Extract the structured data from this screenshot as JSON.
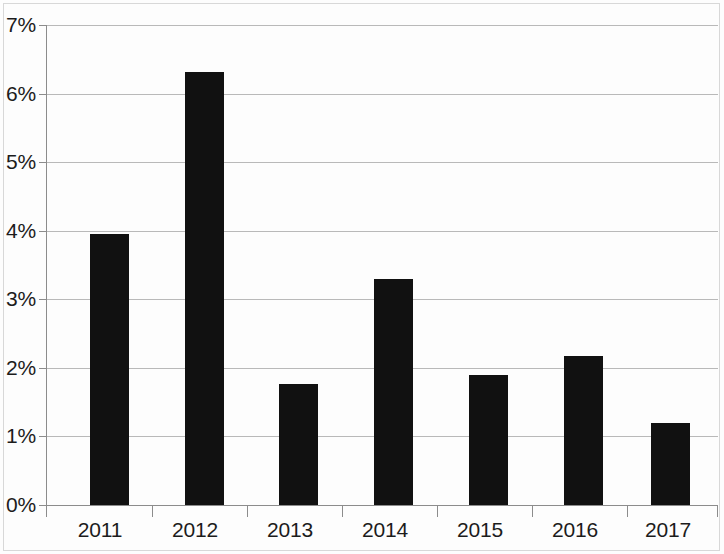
{
  "chart_data": {
    "type": "bar",
    "title": "",
    "subtitle": "",
    "xlabel": "",
    "ylabel": "",
    "categories": [
      "2011",
      "2012",
      "2013",
      "2014",
      "2015",
      "2016",
      "2017"
    ],
    "values": [
      3.95,
      6.32,
      1.76,
      3.3,
      1.9,
      2.18,
      1.2
    ],
    "value_format": "percent",
    "ylim": [
      0,
      7
    ],
    "ytick_labels": [
      "0%",
      "1%",
      "2%",
      "3%",
      "4%",
      "5%",
      "6%",
      "7%"
    ],
    "ytick_values": [
      0,
      1,
      2,
      3,
      4,
      5,
      6,
      7
    ],
    "grid": true,
    "grid_axis": "y",
    "legend": false,
    "legend_position": "none",
    "series": [
      {
        "name": "",
        "values": [
          3.95,
          6.32,
          1.76,
          3.3,
          1.9,
          2.18,
          1.2
        ],
        "color": "#111111"
      }
    ],
    "colors": {
      "bar": "#111111",
      "grid": "#b9b9b9",
      "axis": "#8c8c8c",
      "background": "#fdfdfd",
      "text": "#1c1c1c"
    },
    "annotations": []
  }
}
